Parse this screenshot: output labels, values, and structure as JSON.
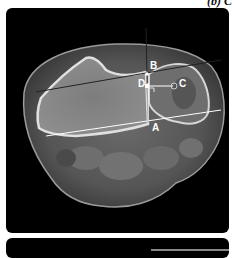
{
  "caption": "(b) C",
  "figure": {
    "type": "axial CT scan",
    "labels": {
      "a": "A",
      "b": "B",
      "c": "C",
      "d": "D"
    }
  }
}
